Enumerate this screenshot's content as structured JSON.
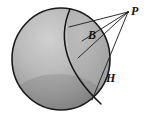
{
  "figure": {
    "type": "geometry-diagram",
    "background_color": "#ffffff",
    "canvas": {
      "width": 147,
      "height": 116
    },
    "sphere": {
      "name": "shaded-sphere",
      "center_x": 61,
      "center_y": 59,
      "radius_x": 49,
      "radius_y": 51,
      "outline_color": "#1a1a1a",
      "outline_width": 1.6,
      "fill_light": "#c9c9c9",
      "fill_mid": "#a3a3a3",
      "fill_dark": "#7c7c7c",
      "fill_edge": "#636363"
    },
    "points": [
      {
        "id": "P",
        "label": "P",
        "x": 128,
        "y": 12,
        "on_sphere": false
      },
      {
        "id": "B",
        "label": "B",
        "x": 84,
        "y": 42,
        "on_sphere": true
      },
      {
        "id": "H",
        "label": "H",
        "x": 104,
        "y": 72,
        "on_sphere": true
      }
    ],
    "arc": {
      "name": "horizon-arc",
      "color": "#151515",
      "width": 1.5,
      "start_x": 70,
      "start_y": 9,
      "end_x": 101,
      "end_y": 104,
      "bulge_x": 56,
      "bulge_y": 58
    },
    "sight_lines": [
      {
        "name": "line-P-to-upper-chord",
        "from": "P",
        "to_x": 69,
        "to_y": 27
      },
      {
        "name": "line-P-to-B",
        "from": "P",
        "to_x": 82,
        "to_y": 41
      },
      {
        "name": "line-P-to-inner-point",
        "from": "P",
        "to_x": 78,
        "to_y": 58
      },
      {
        "name": "line-P-to-H",
        "from": "P",
        "to_x": 103,
        "to_y": 73
      }
    ],
    "line_color": "#2b2b2b",
    "line_width": 1.0,
    "labels": {
      "P": "P",
      "B": "B",
      "H": "H"
    }
  }
}
